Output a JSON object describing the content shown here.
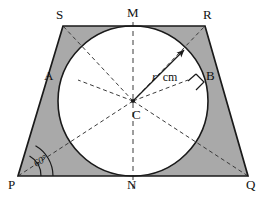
{
  "figure": {
    "shape_name": "trapezoid PQRS",
    "colors": {
      "shaded_region": "#a9a9a9",
      "outline": "#1a1a1a",
      "dashed_line": "#3a3a3a",
      "circle_fill": "#ffffff",
      "background": "#ffffff",
      "label_text": "#111111"
    }
  },
  "labels": {
    "vertex_s": "S",
    "vertex_r": "R",
    "vertex_p": "P",
    "vertex_q": "Q",
    "tangent_m": "M",
    "tangent_n": "N",
    "tangent_a": "A",
    "tangent_b": "B",
    "center_c": "C",
    "radius_symbol": "r",
    "radius_unit": "cm",
    "base_angle": "60°"
  },
  "geometry": {
    "center": {
      "x": 133,
      "y": 101
    },
    "radius": 75,
    "vertices": {
      "S": {
        "x": 63,
        "y": 26
      },
      "R": {
        "x": 205,
        "y": 26
      },
      "P": {
        "x": 18,
        "y": 176
      },
      "Q": {
        "x": 248,
        "y": 176
      }
    },
    "tangent_points": {
      "M": {
        "x": 133,
        "y": 26
      },
      "N": {
        "x": 133,
        "y": 176
      },
      "A": {
        "x": 78,
        "y": 80
      },
      "B": {
        "x": 188,
        "y": 80
      }
    },
    "base_angle_degrees": 60,
    "radius_arrow": {
      "from_x": 133,
      "from_y": 101,
      "to_x": 186,
      "to_y": 48
    },
    "right_angle_marker_at": "B",
    "dashed_radii_to": [
      "S",
      "M",
      "R",
      "A",
      "B",
      "P",
      "N",
      "Q"
    ]
  }
}
